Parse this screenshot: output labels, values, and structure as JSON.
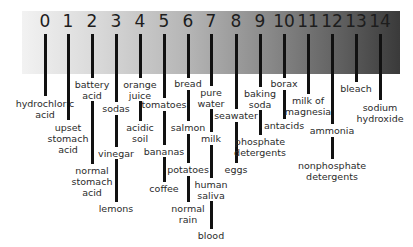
{
  "diagram": {
    "title": "",
    "type": "pH scale",
    "scale_numbers": [
      "0",
      "1",
      "2",
      "3",
      "4",
      "5",
      "6",
      "7",
      "8",
      "9",
      "10",
      "11",
      "12",
      "13",
      "14"
    ],
    "gradient_colors": {
      "acidic_end": "#f2f2f2",
      "basic_end": "#3a3a3a"
    },
    "ph_items": [
      {
        "ph": 0,
        "labels": [
          "hydrochloric\nacid"
        ]
      },
      {
        "ph": 1,
        "labels": [
          "upset\nstomach\nacid"
        ]
      },
      {
        "ph": 2,
        "labels": [
          "battery\nacid",
          "normal\nstomach\nacid"
        ]
      },
      {
        "ph": 3,
        "labels": [
          "sodas",
          "vinegar",
          "lemons"
        ]
      },
      {
        "ph": 4,
        "labels": [
          "orange\njuice",
          "acidic\nsoil"
        ]
      },
      {
        "ph": 5,
        "labels": [
          "tomatoes",
          "bananas",
          "coffee"
        ]
      },
      {
        "ph": 6,
        "labels": [
          "bread",
          "salmon",
          "potatoes",
          "normal\nrain"
        ]
      },
      {
        "ph": 7,
        "labels": [
          "pure\nwater",
          "milk",
          "human\nsaliva",
          "blood"
        ]
      },
      {
        "ph": 8,
        "labels": [
          "seawater",
          "eggs"
        ]
      },
      {
        "ph": 9,
        "labels": [
          "baking\nsoda",
          "phosphate\ndetergents"
        ]
      },
      {
        "ph": 10,
        "labels": [
          "borax",
          "antacids"
        ]
      },
      {
        "ph": 11,
        "labels": [
          "milk of\nmagnesia"
        ]
      },
      {
        "ph": 12,
        "labels": [
          "ammonia",
          "nonphosphate\ndetergents"
        ]
      },
      {
        "ph": 13,
        "labels": [
          "bleach"
        ]
      },
      {
        "ph": 14,
        "labels": [
          "sodium\nhydroxide"
        ]
      }
    ]
  },
  "labels": {
    "n0": "0",
    "n1": "1",
    "n2": "2",
    "n3": "3",
    "n4": "4",
    "n5": "5",
    "n6": "6",
    "n7": "7",
    "n8": "8",
    "n9": "9",
    "n10": "10",
    "n11": "11",
    "n12": "12",
    "n13": "13",
    "n14": "14",
    "hydrochloric_acid": "hydrochloric\nacid",
    "upset_stomach_acid": "upset\nstomach\nacid",
    "battery_acid": "battery\nacid",
    "normal_stomach_acid": "normal\nstomach\nacid",
    "sodas": "sodas",
    "vinegar": "vinegar",
    "lemons": "lemons",
    "orange_juice": "orange\njuice",
    "acidic_soil": "acidic\nsoil",
    "tomatoes": "tomatoes",
    "bananas": "bananas",
    "coffee": "coffee",
    "bread": "bread",
    "salmon": "salmon",
    "potatoes": "potatoes",
    "normal_rain": "normal\nrain",
    "pure_water": "pure\nwater",
    "milk": "milk",
    "human_saliva": "human\nsaliva",
    "blood": "blood",
    "seawater": "seawater",
    "eggs": "eggs",
    "baking_soda": "baking\nsoda",
    "phosphate_detergents": "phosphate\ndetergents",
    "borax": "borax",
    "antacids": "antacids",
    "milk_of_magnesia": "milk of\nmagnesia",
    "ammonia": "ammonia",
    "nonphosphate_detergents": "nonphosphate\ndetergents",
    "bleach": "bleach",
    "sodium_hydroxide": "sodium\nhydroxide"
  }
}
